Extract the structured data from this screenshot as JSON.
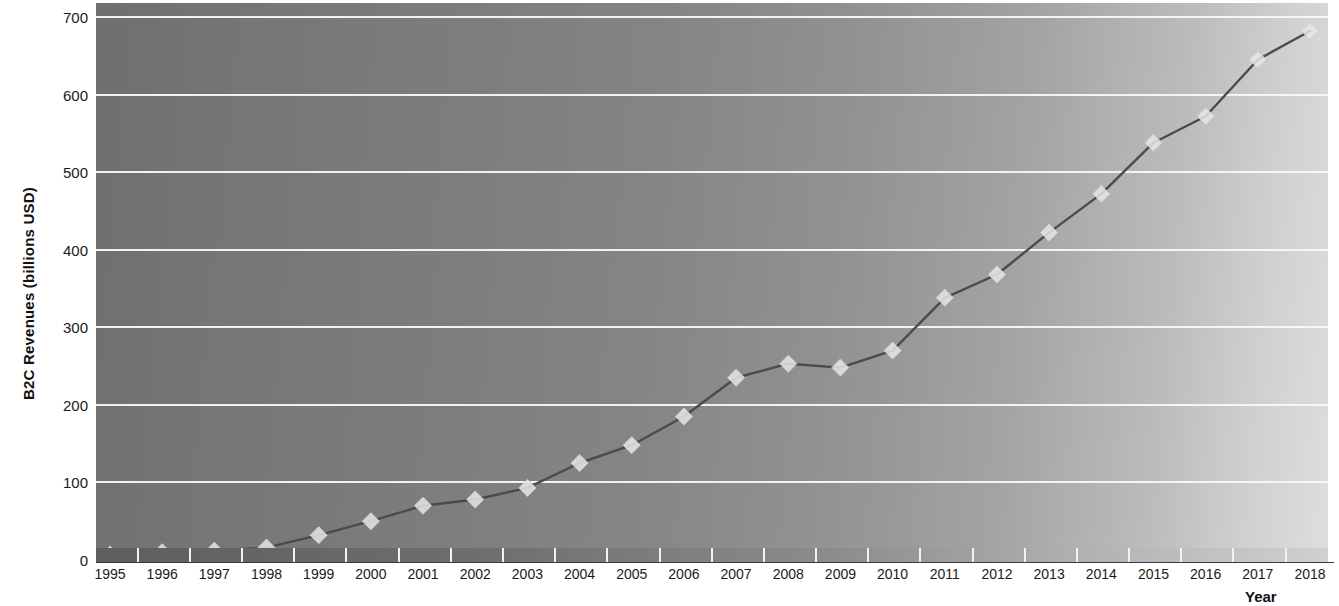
{
  "chart_data": {
    "type": "line",
    "title": "",
    "xlabel": "Year",
    "ylabel": "B2C Revenues (billions USD)",
    "x": [
      1995,
      1996,
      1997,
      1998,
      1999,
      2000,
      2001,
      2002,
      2003,
      2004,
      2005,
      2006,
      2007,
      2008,
      2009,
      2010,
      2011,
      2012,
      2013,
      2014,
      2015,
      2016,
      2017,
      2018
    ],
    "categories": [
      "1995",
      "1996",
      "1997",
      "1998",
      "1999",
      "2000",
      "2001",
      "2002",
      "2003",
      "2004",
      "2005",
      "2006",
      "2007",
      "2008",
      "2009",
      "2010",
      "2011",
      "2012",
      "2013",
      "2014",
      "2015",
      "2016",
      "2017",
      "2018"
    ],
    "values": [
      7,
      10,
      12,
      16,
      32,
      50,
      70,
      78,
      93,
      125,
      148,
      185,
      235,
      253,
      248,
      270,
      338,
      368,
      422,
      472,
      538,
      572,
      645,
      682
    ],
    "series": [
      {
        "name": "B2C Revenues",
        "values": [
          7,
          10,
          12,
          16,
          32,
          50,
          70,
          78,
          93,
          125,
          148,
          185,
          235,
          253,
          248,
          270,
          338,
          368,
          422,
          472,
          538,
          572,
          645,
          682
        ]
      }
    ],
    "ytick_labels": [
      "700",
      "600",
      "500",
      "400",
      "300",
      "200",
      "100",
      "0"
    ],
    "yticks": [
      700,
      600,
      500,
      400,
      300,
      200,
      100,
      0
    ],
    "ylim": [
      0,
      713
    ],
    "xlim": [
      1995,
      2018
    ],
    "grid": "horizontal",
    "legend": "none",
    "marker": "diamond",
    "line_color": "#4a4a4a",
    "marker_color": "#e8e8e8",
    "gridline_color": "#fdfdfd",
    "plot_background": "gray-gradient-left-dark-to-right-light"
  }
}
